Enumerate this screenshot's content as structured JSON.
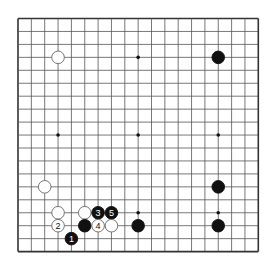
{
  "board": {
    "size": 19,
    "origin_x": 18,
    "origin_y": 18.5,
    "step_x": 13.35,
    "step_y": 12.95,
    "line_color": "#555555",
    "border_color": "#333333",
    "hoshi": [
      [
        3,
        3
      ],
      [
        9,
        3
      ],
      [
        15,
        3
      ],
      [
        3,
        9
      ],
      [
        9,
        9
      ],
      [
        15,
        9
      ],
      [
        3,
        15
      ],
      [
        9,
        15
      ],
      [
        15,
        15
      ]
    ]
  },
  "stones": [
    {
      "color": "white",
      "col": 3,
      "row": 3,
      "label": ""
    },
    {
      "color": "black",
      "col": 15,
      "row": 3,
      "label": ""
    },
    {
      "color": "white",
      "col": 2,
      "row": 13,
      "label": ""
    },
    {
      "color": "black",
      "col": 15,
      "row": 13,
      "label": ""
    },
    {
      "color": "black",
      "col": 15,
      "row": 16,
      "label": ""
    },
    {
      "color": "black",
      "col": 9,
      "row": 16,
      "label": ""
    },
    {
      "color": "white",
      "col": 3,
      "row": 15,
      "label": ""
    },
    {
      "color": "white",
      "col": 5,
      "row": 15,
      "label": ""
    },
    {
      "color": "black",
      "col": 6,
      "row": 15,
      "label": "3"
    },
    {
      "color": "black",
      "col": 7,
      "row": 15,
      "label": "5"
    },
    {
      "color": "white",
      "col": 3,
      "row": 16,
      "label": "2"
    },
    {
      "color": "black",
      "col": 5,
      "row": 16,
      "label": ""
    },
    {
      "color": "white",
      "col": 6,
      "row": 16,
      "label": "4"
    },
    {
      "color": "white",
      "col": 7,
      "row": 16,
      "label": ""
    },
    {
      "color": "black",
      "col": 4,
      "row": 17,
      "label": "1"
    }
  ]
}
